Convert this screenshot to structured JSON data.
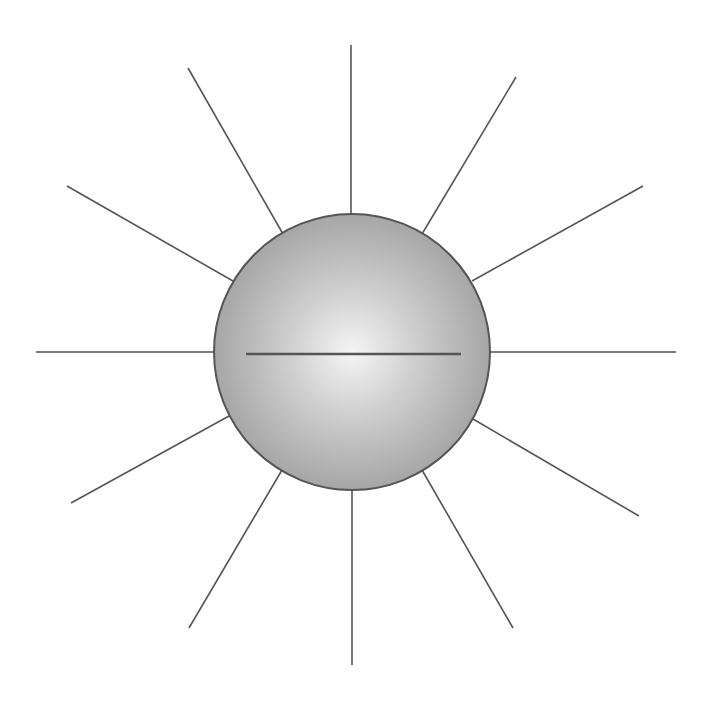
{
  "diagram": {
    "colors": {
      "background": "#ffffff",
      "stroke": "#555555",
      "sphere_highlight": "#f5f5f5",
      "sphere_mid": "#cfcfcf",
      "sphere_edge": "#a6a6a6"
    },
    "sphere": {
      "cx": 352,
      "cy": 352,
      "r": 138
    },
    "diameter_line": {
      "x1": 246,
      "y1": 354,
      "x2": 461,
      "y2": 354
    },
    "rays": [
      {
        "name": "ray-top",
        "x1": 351,
        "y1": 45,
        "x2": 351,
        "y2": 214
      },
      {
        "name": "ray-top-right",
        "x1": 516,
        "y1": 77,
        "x2": 422,
        "y2": 234
      },
      {
        "name": "ray-upper-right",
        "x1": 643,
        "y1": 186,
        "x2": 472,
        "y2": 281
      },
      {
        "name": "ray-right",
        "x1": 676,
        "y1": 352,
        "x2": 491,
        "y2": 352
      },
      {
        "name": "ray-lower-right",
        "x1": 639,
        "y1": 516,
        "x2": 473,
        "y2": 419
      },
      {
        "name": "ray-bottom-right",
        "x1": 513,
        "y1": 628,
        "x2": 422,
        "y2": 470
      },
      {
        "name": "ray-bottom",
        "x1": 352,
        "y1": 665,
        "x2": 352,
        "y2": 490
      },
      {
        "name": "ray-bottom-left",
        "x1": 189,
        "y1": 628,
        "x2": 282,
        "y2": 470
      },
      {
        "name": "ray-lower-left",
        "x1": 71,
        "y1": 503,
        "x2": 229,
        "y2": 416
      },
      {
        "name": "ray-left",
        "x1": 36,
        "y1": 352,
        "x2": 214,
        "y2": 352
      },
      {
        "name": "ray-upper-left",
        "x1": 67,
        "y1": 186,
        "x2": 233,
        "y2": 281
      },
      {
        "name": "ray-top-left",
        "x1": 188,
        "y1": 68,
        "x2": 283,
        "y2": 234
      }
    ]
  }
}
